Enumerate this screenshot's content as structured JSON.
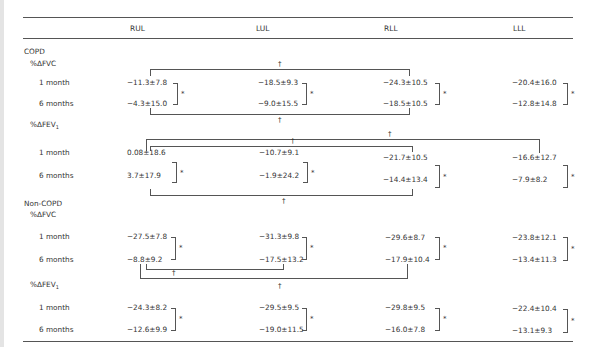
{
  "table": {
    "columns": [
      "",
      "RUL",
      "LUL",
      "RLL",
      "LLL"
    ],
    "groups": [
      {
        "label": "COPD",
        "measures": [
          {
            "label": "%ΔFVC",
            "rows": [
              {
                "label": "1 month",
                "values": [
                  "−11.3±7.8",
                  "−18.5±9.3",
                  "−24.3±10.5",
                  "−20.4±16.0"
                ]
              },
              {
                "label": "6 months",
                "values": [
                  "−4.3±15.0",
                  "−9.0±15.5",
                  "−18.5±10.5",
                  "−12.8±14.8"
                ]
              }
            ]
          },
          {
            "label": "%ΔFEV",
            "label_sub": "1",
            "rows": [
              {
                "label": "1 month",
                "values": [
                  "0.08±18.6",
                  "−10.7±9.1",
                  "−21.7±10.5",
                  "−16.6±12.7"
                ]
              },
              {
                "label": "6 months",
                "values": [
                  "3.7±17.9",
                  "−1.9±24.2",
                  "−14.4±13.4",
                  "−7.9±8.2"
                ]
              }
            ]
          }
        ]
      },
      {
        "label": "Non-COPD",
        "measures": [
          {
            "label": "%ΔFVC",
            "rows": [
              {
                "label": "1 month",
                "values": [
                  "−27.5±7.8",
                  "−31.3±9.8",
                  "−29.6±8.7",
                  "−23.8±12.1"
                ]
              },
              {
                "label": "6 months",
                "values": [
                  "−8.8±9.2",
                  "−17.5±13.2",
                  "−17.9±10.4",
                  "−13.4±11.3"
                ]
              }
            ]
          },
          {
            "label": "%ΔFEV",
            "label_sub": "1",
            "rows": [
              {
                "label": "1 month",
                "values": [
                  "−24.3±8.2",
                  "−29.5±9.5",
                  "−29.8±9.5",
                  "−22.4±10.4"
                ]
              },
              {
                "label": "6 months",
                "values": [
                  "−12.6±9.9",
                  "−19.0±11.5",
                  "−16.0±7.8",
                  "−13.1±9.3"
                ]
              }
            ]
          }
        ]
      }
    ],
    "symbols": {
      "significant_within": "*",
      "significant_between": "†"
    }
  }
}
